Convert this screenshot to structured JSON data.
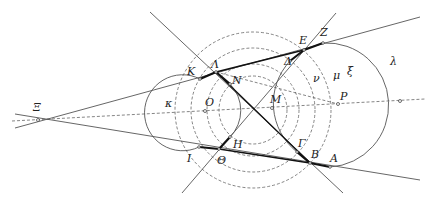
{
  "diagram": {
    "title": "",
    "points": {
      "Xi": {
        "label": "Ξ",
        "x": 38,
        "y": 120
      },
      "O": {
        "label": "O",
        "x": 205,
        "y": 111
      },
      "M": {
        "label": "M",
        "x": 272,
        "y": 108
      },
      "P": {
        "label": "P",
        "x": 338,
        "y": 104
      },
      "K": {
        "label": "K",
        "x": 200,
        "y": 79
      },
      "Lambda": {
        "label": "Λ",
        "x": 216,
        "y": 72
      },
      "N": {
        "label": "N",
        "x": 230,
        "y": 84
      },
      "E": {
        "label": "E",
        "x": 304,
        "y": 50
      },
      "Z": {
        "label": "Z",
        "x": 323,
        "y": 43
      },
      "Delta": {
        "label": "Δ",
        "x": 290,
        "y": 61
      },
      "H": {
        "label": "H",
        "x": 230,
        "y": 137
      },
      "Theta": {
        "label": "Θ",
        "x": 219,
        "y": 149
      },
      "I": {
        "label": "I",
        "x": 199,
        "y": 147
      },
      "Gamma": {
        "label": "Γ",
        "x": 297,
        "y": 152
      },
      "B": {
        "label": "B",
        "x": 310,
        "y": 163
      },
      "A": {
        "label": "A",
        "x": 330,
        "y": 167
      }
    },
    "circle_labels": {
      "kappa": "κ",
      "lambda": "λ",
      "nu": "ν",
      "mu": "μ",
      "xi": "ξ"
    }
  }
}
